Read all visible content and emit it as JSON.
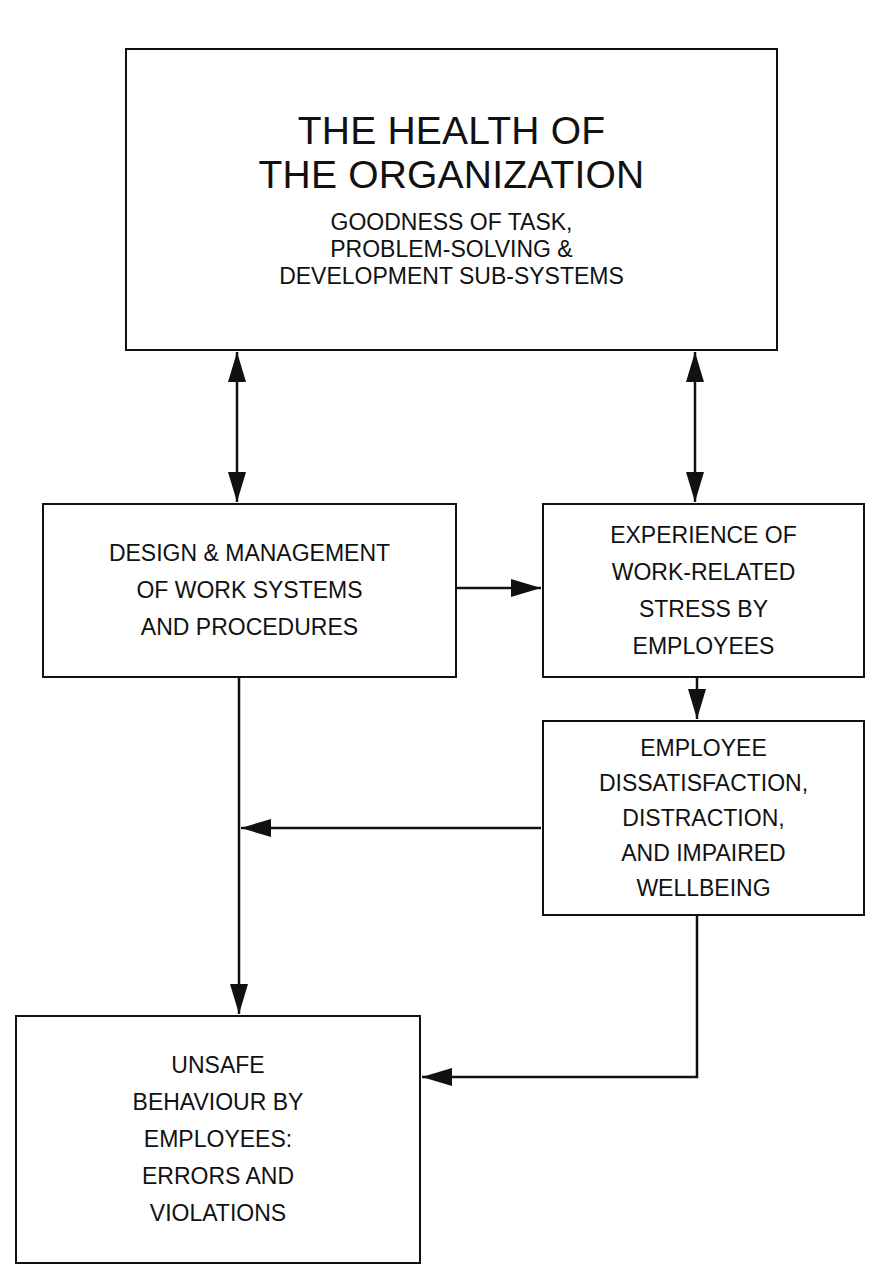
{
  "diagram": {
    "nodes": {
      "health": {
        "title_lines": [
          "THE HEALTH OF",
          "THE ORGANIZATION"
        ],
        "subtitle_lines": [
          "GOODNESS OF TASK,",
          "PROBLEM-SOLVING &",
          "DEVELOPMENT SUB-SYSTEMS"
        ]
      },
      "design": {
        "lines": [
          "DESIGN & MANAGEMENT",
          "OF WORK SYSTEMS",
          "AND PROCEDURES"
        ]
      },
      "stress": {
        "lines": [
          "EXPERIENCE OF",
          "WORK-RELATED",
          "STRESS BY",
          "EMPLOYEES"
        ]
      },
      "dissatisfaction": {
        "lines": [
          "EMPLOYEE",
          "DISSATISFACTION,",
          "DISTRACTION,",
          "AND IMPAIRED",
          "WELLBEING"
        ]
      },
      "unsafe": {
        "lines": [
          "UNSAFE",
          "BEHAVIOUR BY",
          "EMPLOYEES:",
          "ERRORS AND",
          "VIOLATIONS"
        ]
      }
    },
    "edges": [
      {
        "from": "health",
        "to": "design",
        "type": "bidirectional"
      },
      {
        "from": "health",
        "to": "stress",
        "type": "bidirectional"
      },
      {
        "from": "design",
        "to": "stress",
        "type": "directed"
      },
      {
        "from": "stress",
        "to": "dissatisfaction",
        "type": "directed"
      },
      {
        "from": "dissatisfaction",
        "to": "design-unsafe-link",
        "type": "directed"
      },
      {
        "from": "design",
        "to": "unsafe",
        "type": "directed"
      },
      {
        "from": "dissatisfaction",
        "to": "unsafe",
        "type": "directed"
      }
    ],
    "colors": {
      "stroke": "#111111",
      "background": "#ffffff"
    }
  }
}
